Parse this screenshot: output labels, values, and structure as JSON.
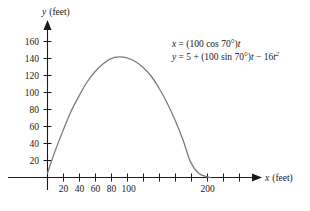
{
  "chart_data": {
    "type": "line",
    "title": "",
    "subtitle": "",
    "xlabel": "x (feet)",
    "ylabel": "y (feet)",
    "xlabel_var": "x",
    "xlabel_unit": "(feet)",
    "ylabel_var": "y",
    "ylabel_unit": "(feet)",
    "grid": false,
    "legend": "none",
    "xlim": [
      0,
      240
    ],
    "ylim": [
      0,
      172
    ],
    "x_ticks": [
      20,
      40,
      60,
      80,
      100,
      120,
      140,
      160,
      180,
      200,
      220
    ],
    "x_tick_labels": [
      "20",
      "40",
      "60",
      "80",
      "100",
      "",
      "",
      "",
      "",
      "200",
      ""
    ],
    "y_ticks": [
      20,
      40,
      60,
      80,
      100,
      120,
      140,
      160
    ],
    "y_tick_labels": [
      "20",
      "40",
      "60",
      "80",
      "100",
      "120",
      "140",
      "160"
    ],
    "curve_color": "#7b7b7b",
    "axis_color": "#1a1a1a",
    "series": [
      {
        "name": "projectile path",
        "x": [
          0,
          5,
          10,
          20,
          30,
          40,
          50,
          60,
          70,
          80,
          90,
          100,
          110,
          120,
          130,
          140,
          150,
          160,
          170,
          180,
          190,
          200,
          205
        ],
        "y": [
          5,
          19,
          32,
          56,
          78,
          96,
          112,
          124,
          133,
          139,
          141,
          140,
          136,
          129,
          119,
          105,
          88,
          68,
          45,
          18,
          5,
          1,
          0
        ]
      }
    ],
    "annotations": [
      {
        "id": "parametric-equations",
        "lines": [
          "x = (100 cos 70°)t",
          "y = 5 + (100 sin 70°)t − 16t²"
        ],
        "eq1": {
          "lhs": "x",
          "eq": " = (100 ",
          "fn": "cos",
          "angle": " 70°)",
          "var": "t"
        },
        "eq2": {
          "lhs": "y",
          "eq": " = 5 + (100 ",
          "fn": "sin",
          "angle": " 70°)",
          "var": "t",
          "tail": " − 16",
          "var2": "t",
          "exp": "2"
        }
      }
    ]
  }
}
